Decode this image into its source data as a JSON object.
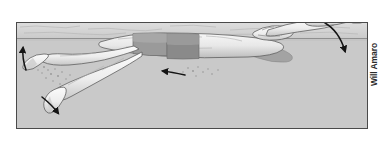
{
  "figure": {
    "credit": "Will Amaro",
    "frame": {
      "x": 16,
      "y": 22,
      "width": 352,
      "height": 107,
      "border_color": "#4a4a4a"
    },
    "colors": {
      "above_water": "#d9d9d9",
      "surface_band": "#cfcfcf",
      "underwater": "#c9c9c9",
      "body_light": "#f2f2f2",
      "body_mid": "#d2d2d2",
      "body_shadow": "#a8a8a8",
      "suit_dark": "#8e8e8e",
      "suit_mid": "#a5a5a5",
      "outline": "#5a5a5a",
      "arrow": "#1a1a1a",
      "page_background": "#ffffff"
    },
    "water": {
      "surface_line_y": 38,
      "surface_top_y": 22,
      "label": "water surface"
    },
    "annotations": {
      "arrow_left_leg_up": "upward recovery of lower leg",
      "arrow_left_foot_down": "downward kick of trailing foot",
      "arrow_body_direction": "direction of body travel",
      "arrow_hand_entry": "hand entry and catch direction",
      "bubbles": "turbulence bubbles from kick"
    },
    "swimmer": {
      "stroke": "backstroke",
      "parts": [
        "lead-arm",
        "hand",
        "head",
        "torso",
        "swimsuit",
        "upper-leg",
        "lower-leg",
        "foot"
      ]
    }
  }
}
